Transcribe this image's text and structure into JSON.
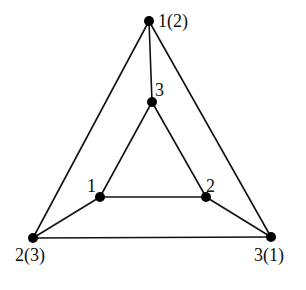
{
  "diagram": {
    "type": "graph",
    "colors": {
      "edge": "#111111",
      "node": "#000000",
      "background": "#ffffff"
    },
    "nodes": [
      {
        "id": "outer_top",
        "x": 149,
        "y": 21,
        "label": "1(2)",
        "label_x": 158,
        "label_y": 27,
        "anchor": "start"
      },
      {
        "id": "outer_left",
        "x": 33,
        "y": 238,
        "label": "2(3)",
        "label_x": 15,
        "label_y": 261,
        "anchor": "start"
      },
      {
        "id": "outer_right",
        "x": 271,
        "y": 237,
        "label": "3(1)",
        "label_x": 254,
        "label_y": 261,
        "anchor": "start"
      },
      {
        "id": "inner_top",
        "x": 152,
        "y": 102,
        "label": "3",
        "label_x": 155,
        "label_y": 96,
        "anchor": "start"
      },
      {
        "id": "inner_left",
        "x": 100,
        "y": 197,
        "label": "1",
        "label_x": 87,
        "label_y": 192,
        "anchor": "start"
      },
      {
        "id": "inner_right",
        "x": 206,
        "y": 197,
        "label": "2",
        "label_x": 206,
        "label_y": 192,
        "anchor": "start"
      }
    ],
    "edges": [
      {
        "from": "outer_top",
        "to": "outer_left"
      },
      {
        "from": "outer_top",
        "to": "outer_right"
      },
      {
        "from": "outer_left",
        "to": "outer_right"
      },
      {
        "from": "inner_top",
        "to": "inner_left"
      },
      {
        "from": "inner_top",
        "to": "inner_right"
      },
      {
        "from": "inner_left",
        "to": "inner_right"
      },
      {
        "from": "outer_top",
        "to": "inner_top"
      },
      {
        "from": "outer_left",
        "to": "inner_left"
      },
      {
        "from": "outer_right",
        "to": "inner_right"
      }
    ]
  }
}
